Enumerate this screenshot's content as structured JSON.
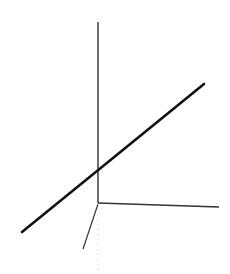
{
  "diagram": {
    "type": "3d-axes-with-line",
    "background": "#ffffff",
    "axes": {
      "color": "#222222",
      "vertical": {
        "x1": 98,
        "y1": 22,
        "x2": 98,
        "y2": 203
      },
      "horizontal": {
        "x1": 98,
        "y1": 203,
        "x2": 219,
        "y2": 207
      },
      "depth": {
        "x1": 98,
        "y1": 204,
        "x2": 83,
        "y2": 249
      },
      "depth_hidden": {
        "x1": 98,
        "y1": 204,
        "x2": 98,
        "y2": 272
      }
    },
    "line": {
      "color": "#111111",
      "x1": 22,
      "y1": 232,
      "x2": 204,
      "y2": 84
    }
  }
}
